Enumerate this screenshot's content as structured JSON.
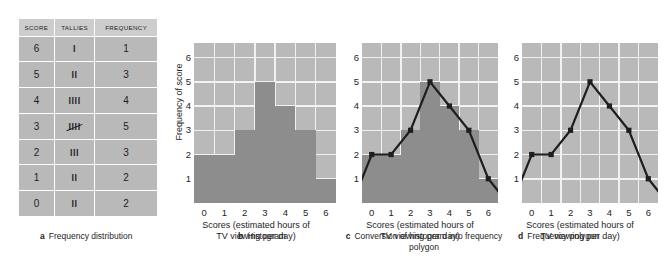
{
  "figure": {
    "colors": {
      "page_background": "#ffffff",
      "plot_background": "#b9b9b9",
      "bar_fill": "#8d8d8d",
      "gridline": "#f2f2f2",
      "header_cell": "#cdcdcd",
      "cell": "#b9b9b9",
      "ink": "#1e1e1e"
    }
  },
  "panel_a": {
    "caption_letter": "a",
    "caption_text": "Frequency distribution",
    "headers": [
      "SCORE",
      "TALLIES",
      "FREQUENCY"
    ],
    "rows": [
      {
        "score": "6",
        "tally": "l",
        "crossed": false,
        "frequency": "1"
      },
      {
        "score": "5",
        "tally": "ll",
        "crossed": false,
        "frequency": "3"
      },
      {
        "score": "4",
        "tally": "llll",
        "crossed": false,
        "frequency": "4"
      },
      {
        "score": "3",
        "tally": "llll",
        "crossed": true,
        "frequency": "5"
      },
      {
        "score": "2",
        "tally": "lll",
        "crossed": false,
        "frequency": "3"
      },
      {
        "score": "1",
        "tally": "ll",
        "crossed": false,
        "frequency": "2"
      },
      {
        "score": "0",
        "tally": "ll",
        "crossed": false,
        "frequency": "2"
      }
    ]
  },
  "panel_b": {
    "caption_letter": "b",
    "caption_text": "Histogram"
  },
  "panel_c": {
    "caption_letter": "c",
    "caption_text": "Conversion of histogram into frequency polygon"
  },
  "panel_d": {
    "caption_letter": "d",
    "caption_text": "Frequency polygon"
  },
  "chart_data": [
    {
      "id": "panel_b",
      "type": "bar",
      "title": "Histogram",
      "xlabel": "Scores (estimated hours of TV viewing per day)",
      "ylabel": "Frequency of score",
      "categories": [
        "0",
        "1",
        "2",
        "3",
        "4",
        "5",
        "6"
      ],
      "x": [
        0,
        1,
        2,
        3,
        4,
        5,
        6
      ],
      "values": [
        2,
        2,
        3,
        5,
        4,
        3,
        1
      ],
      "xticks": [
        "0",
        "1",
        "2",
        "3",
        "4",
        "5",
        "6"
      ],
      "yticks": [
        "1",
        "2",
        "3",
        "4",
        "5",
        "6"
      ],
      "ylim": [
        0,
        6.6
      ],
      "xlim": [
        -0.5,
        6.5
      ],
      "grid": true,
      "legend": "none"
    },
    {
      "id": "panel_c",
      "type": "bar+line",
      "title": "Conversion of histogram into frequency polygon",
      "xlabel": "Scores (estimated hours of TV viewing per day)",
      "ylabel": "Frequency of score",
      "categories": [
        "0",
        "1",
        "2",
        "3",
        "4",
        "5",
        "6"
      ],
      "x": [
        0,
        1,
        2,
        3,
        4,
        5,
        6
      ],
      "values": [
        2,
        2,
        3,
        5,
        4,
        3,
        1
      ],
      "series": [
        {
          "name": "frequency polygon",
          "x": [
            -1,
            0,
            1,
            2,
            3,
            4,
            5,
            6,
            7
          ],
          "values": [
            0,
            2,
            2,
            3,
            5,
            4,
            3,
            1,
            0
          ],
          "markers_at": [
            0,
            1,
            2,
            3,
            4,
            5,
            6
          ]
        }
      ],
      "xticks": [
        "0",
        "1",
        "2",
        "3",
        "4",
        "5",
        "6"
      ],
      "yticks": [
        "1",
        "2",
        "3",
        "4",
        "5",
        "6"
      ],
      "ylim": [
        0,
        6.6
      ],
      "xlim": [
        -0.5,
        6.5
      ],
      "grid": true,
      "legend": "none"
    },
    {
      "id": "panel_d",
      "type": "line",
      "title": "Frequency polygon",
      "xlabel": "Scores (estimated hours of TV viewing per day)",
      "ylabel": "Frequency of score",
      "categories": [
        "0",
        "1",
        "2",
        "3",
        "4",
        "5",
        "6"
      ],
      "series": [
        {
          "name": "frequency polygon",
          "x": [
            -1,
            0,
            1,
            2,
            3,
            4,
            5,
            6,
            7
          ],
          "values": [
            0,
            2,
            2,
            3,
            5,
            4,
            3,
            1,
            0
          ],
          "markers_at": [
            0,
            1,
            2,
            3,
            4,
            5,
            6
          ]
        }
      ],
      "xticks": [
        "0",
        "1",
        "2",
        "3",
        "4",
        "5",
        "6"
      ],
      "yticks": [
        "1",
        "2",
        "3",
        "4",
        "5",
        "6"
      ],
      "ylim": [
        0,
        6.6
      ],
      "xlim": [
        -0.5,
        6.5
      ],
      "grid": true,
      "legend": "none"
    }
  ]
}
